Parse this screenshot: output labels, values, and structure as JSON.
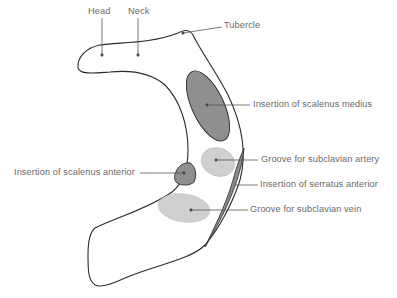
{
  "diagram": {
    "labels": {
      "head": "Head",
      "neck": "Neck",
      "tubercle": "Tubercle",
      "scalenus_medius": "Insertion of scalenus medius",
      "subclavian_artery": "Groove for subclavian artery",
      "scalenus_anterior": "Insertion of scalenus anterior",
      "serratus_anterior": "Insertion of serratus anterior",
      "subclavian_vein": "Groove for subclavian vein"
    },
    "colors": {
      "outline": "#2a2a2a",
      "dark_fill": "#8f8f8f",
      "light_fill": "#d0d0d0",
      "serratus_fill": "#8a8a8a",
      "label_text": "#6a6a6a",
      "leader_line": "#555555"
    }
  }
}
